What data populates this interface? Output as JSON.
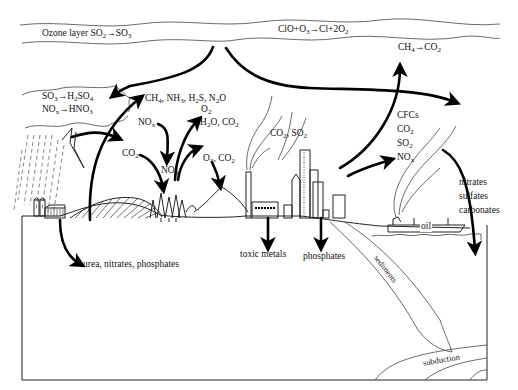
{
  "diagram": {
    "labels": {
      "ozone_layer": "Ozone layer SO2→SO3",
      "ozone_reaction": "ClO+O3→Cl+2O2",
      "methane_oxidation": "CH4→CO2",
      "acid_rain_sulfur": "SO3→H2SO4",
      "acid_rain_nitrogen": "NOx→HNO3",
      "biogenic_gases": "CH4, NH3, H2S, N2O",
      "o2_top": "O2",
      "nox_in": "NOx",
      "h2o_co2": "H2O, CO2",
      "co2_in": "CO2",
      "no3": "NO3",
      "o2_co2": "O2, CO2",
      "smokestack": "CO2, SO2",
      "city_emissions": [
        "CFCs",
        "CO2",
        "SO2",
        "NOx"
      ],
      "ocean_deposits": [
        "nitrates",
        "sulfates",
        "carbonates"
      ],
      "oil": "oil",
      "farm_runoff": "urea, nitrates, phosphates",
      "toxic_metals": "toxic metals",
      "phosphates": "phosphates",
      "sediments": "sediments",
      "subduction": "subduction"
    },
    "arrows": [
      {
        "from": "ozone layer",
        "to": "acid rain cloud"
      },
      {
        "from": "ozone layer",
        "to": "ocean / emissions"
      },
      {
        "from": "farm field",
        "to": "biogenic gases"
      },
      {
        "from": "storm cloud",
        "to": "forest"
      },
      {
        "from": "NOx",
        "to": "forest (NO3)"
      },
      {
        "from": "CO2",
        "to": "forest"
      },
      {
        "from": "forest",
        "to": "H2O, CO2"
      },
      {
        "from": "O2, CO2",
        "to": "hill"
      },
      {
        "from": "city",
        "to": "CH4→CO2"
      },
      {
        "from": "city",
        "to": "CFCs, CO2, SO2, NOx"
      },
      {
        "from": "ship plume",
        "to": "ocean"
      },
      {
        "from": "farm",
        "to": "groundwater (urea, nitrates, phosphates)"
      },
      {
        "from": "factory",
        "to": "toxic metals"
      },
      {
        "from": "city",
        "to": "phosphates"
      }
    ]
  }
}
